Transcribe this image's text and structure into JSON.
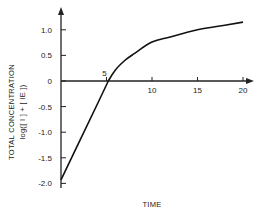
{
  "chart_data": {
    "type": "line",
    "title": "",
    "xlabel": "TIME",
    "ylabel": "TOTAL CONCENTRATION",
    "ylabel_sub": "log([ I ] + [ IE ])",
    "xlim": [
      0,
      21
    ],
    "ylim": [
      -2.1,
      1.4
    ],
    "x_ticks": [
      5,
      10,
      15,
      20
    ],
    "x_tick_labels": [
      "5",
      "10",
      "15",
      "20"
    ],
    "y_ticks": [
      1.0,
      0.5,
      0,
      -0.5,
      -1.0,
      -1.5,
      -2.0
    ],
    "y_tick_labels": [
      "1.0",
      "0.5",
      "0",
      "-0.5",
      "-1.0",
      "-1.5",
      "-2.0"
    ],
    "grid": false,
    "legend": null,
    "series": [
      {
        "name": "total concentration",
        "x": [
          0,
          2,
          4,
          5.2,
          6,
          7,
          8,
          10,
          12,
          15,
          18,
          20
        ],
        "y": [
          -1.93,
          -1.19,
          -0.45,
          0.0,
          0.22,
          0.4,
          0.53,
          0.76,
          0.86,
          1.0,
          1.09,
          1.15
        ]
      }
    ]
  }
}
